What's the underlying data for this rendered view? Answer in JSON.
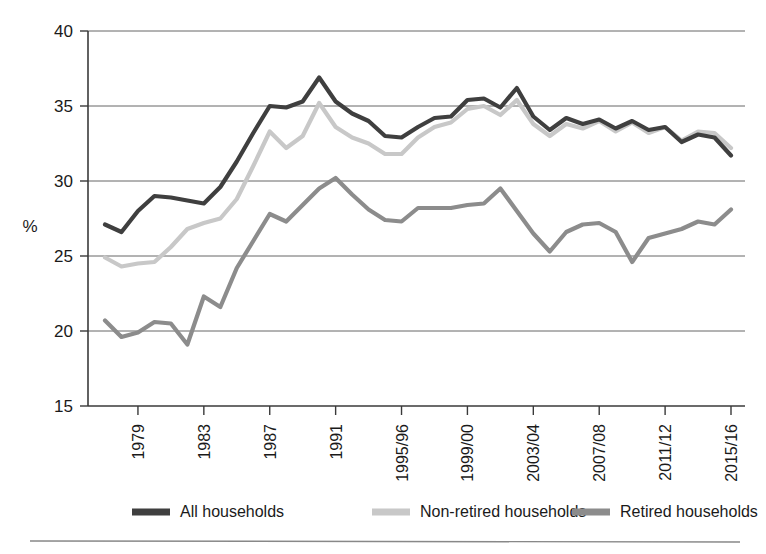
{
  "chart_data": {
    "type": "line",
    "title": "",
    "xlabel": "",
    "ylabel": "%",
    "ylim": [
      15,
      40
    ],
    "yticks": [
      15,
      20,
      25,
      30,
      35,
      40
    ],
    "ytick_labels": [
      "15",
      "20",
      "25",
      "30",
      "35",
      "40"
    ],
    "grid": true,
    "legend_position": "bottom",
    "x": [
      "1977",
      "1978",
      "1979",
      "1980",
      "1981",
      "1982",
      "1983",
      "1984",
      "1985",
      "1986",
      "1987",
      "1988",
      "1989",
      "1990",
      "1991",
      "1992",
      "1993",
      "1994/95",
      "1995/96",
      "1996/97",
      "1997/98",
      "1998/99",
      "1999/00",
      "2000/01",
      "2001/02",
      "2002/03",
      "2003/04",
      "2004/05",
      "2005/06",
      "2006/07",
      "2007/08",
      "2008/09",
      "2009/10",
      "2010/11",
      "2011/12",
      "2012/13",
      "2013/14",
      "2014/15",
      "2015/16"
    ],
    "xtick_labels": [
      "1979",
      "1983",
      "1987",
      "1991",
      "1995/96",
      "1999/00",
      "2003/04",
      "2007/08",
      "2011/12",
      "2015/16"
    ],
    "xtick_indices": [
      2,
      6,
      10,
      14,
      18,
      22,
      26,
      30,
      34,
      38
    ],
    "series": [
      {
        "name": "All households",
        "color": "#3f3f3f",
        "values": [
          27.1,
          26.6,
          28.0,
          29.0,
          28.9,
          28.7,
          28.5,
          29.6,
          31.3,
          33.2,
          35.0,
          34.9,
          35.3,
          36.9,
          35.3,
          34.5,
          34.0,
          33.0,
          32.9,
          33.6,
          34.2,
          34.3,
          35.4,
          35.5,
          34.9,
          36.2,
          34.3,
          33.4,
          34.2,
          33.8,
          34.1,
          33.5,
          34.0,
          33.4,
          33.6,
          32.6,
          33.1,
          32.9,
          31.7
        ]
      },
      {
        "name": "Non-retired households",
        "color": "#c8c8c8",
        "values": [
          24.9,
          24.3,
          24.5,
          24.6,
          25.6,
          26.8,
          27.2,
          27.5,
          28.8,
          31.0,
          33.3,
          32.2,
          33.0,
          35.2,
          33.6,
          32.9,
          32.5,
          31.8,
          31.8,
          32.9,
          33.6,
          33.9,
          34.8,
          35.0,
          34.4,
          35.4,
          33.8,
          33.0,
          33.8,
          33.5,
          34.0,
          33.3,
          33.9,
          33.2,
          33.6,
          32.7,
          33.3,
          33.2,
          32.2
        ]
      },
      {
        "name": "Retired households",
        "color": "#8c8c8c",
        "values": [
          20.7,
          19.6,
          19.9,
          20.6,
          20.5,
          19.1,
          22.3,
          21.6,
          24.2,
          26.0,
          27.8,
          27.3,
          28.4,
          29.5,
          30.2,
          29.1,
          28.1,
          27.4,
          27.3,
          28.2,
          28.2,
          28.2,
          28.4,
          28.5,
          29.5,
          28.0,
          26.5,
          25.3,
          26.6,
          27.1,
          27.2,
          26.6,
          24.6,
          26.2,
          26.5,
          26.8,
          27.3,
          27.1,
          28.1
        ]
      }
    ]
  },
  "legend": {
    "items": [
      {
        "label": "All households",
        "color": "#3f3f3f"
      },
      {
        "label": "Non-retired households",
        "color": "#c8c8c8"
      },
      {
        "label": "Retired households",
        "color": "#8c8c8c"
      }
    ]
  },
  "axes": {
    "y_axis_title": "%"
  }
}
